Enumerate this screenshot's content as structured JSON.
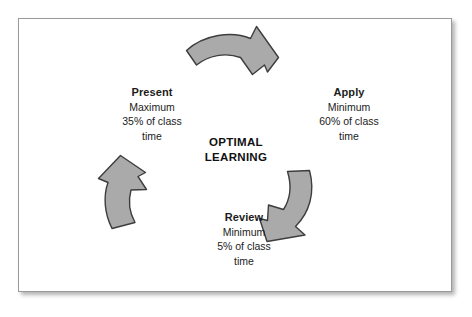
{
  "diagram": {
    "center": {
      "line1": "OPTIMAL",
      "line2": "LEARNING"
    },
    "nodes": [
      {
        "id": "present",
        "title": "Present",
        "qualifier": "Maximum",
        "amount": "35% of class",
        "unit": "time"
      },
      {
        "id": "apply",
        "title": "Apply",
        "qualifier": "Minimum",
        "amount": "60% of class",
        "unit": "time"
      },
      {
        "id": "review",
        "title": "Review",
        "qualifier": "Minimum",
        "amount": "5% of class",
        "unit": "time"
      }
    ],
    "arrows": [
      {
        "id": "top",
        "name": "curved-arrow-present-to-apply"
      },
      {
        "id": "right",
        "name": "curved-arrow-apply-to-review"
      },
      {
        "id": "left",
        "name": "curved-arrow-review-to-present"
      }
    ],
    "colors": {
      "arrow_fill": "#aaaaaa",
      "arrow_stroke": "#3d3d3d",
      "text": "#1c1c1c",
      "frame_border": "#9a9a9a",
      "background": "#ffffff"
    }
  }
}
